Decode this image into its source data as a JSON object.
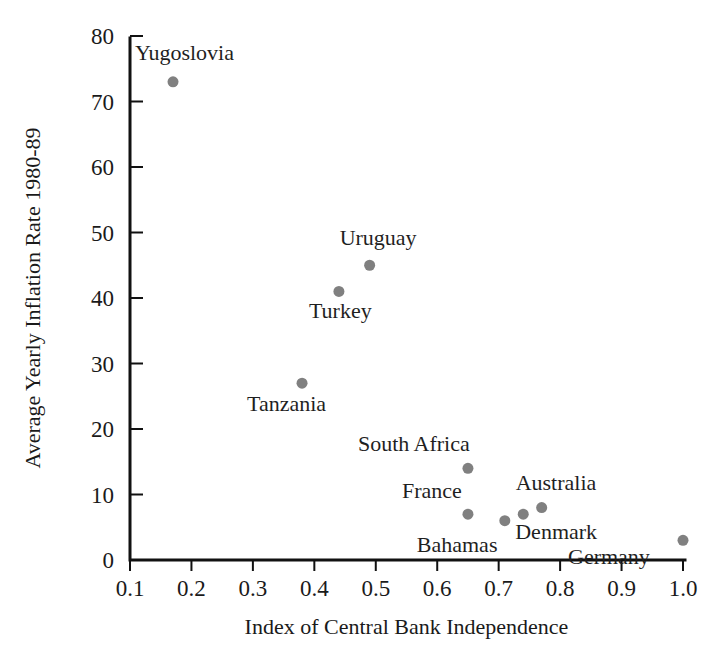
{
  "chart_data": {
    "type": "scatter",
    "title": "",
    "xlabel": "Index of Central Bank Independence",
    "ylabel": "Average Yearly Inflation Rate 1980-89",
    "xlim": [
      0.1,
      1.0
    ],
    "ylim": [
      0,
      80
    ],
    "grid": false,
    "legend": "none",
    "marker_color": "#808080",
    "axis_color": "#111111",
    "xticks": [
      "0.1",
      "0.2",
      "0.3",
      "0.4",
      "0.5",
      "0.6",
      "0.7",
      "0.8",
      "0.9",
      "1.0"
    ],
    "xtick_values": [
      0.1,
      0.2,
      0.3,
      0.4,
      0.5,
      0.6,
      0.7,
      0.8,
      0.9,
      1.0
    ],
    "yticks": [
      "0",
      "10",
      "20",
      "30",
      "40",
      "50",
      "60",
      "70",
      "80"
    ],
    "ytick_values": [
      0,
      10,
      20,
      30,
      40,
      50,
      60,
      70,
      80
    ],
    "points": [
      {
        "label": "Yugoslovia",
        "x": 0.17,
        "y": 73,
        "label_dx": -38,
        "label_dy": -22,
        "label_anchor": "start"
      },
      {
        "label": "Uruguay",
        "x": 0.49,
        "y": 45,
        "label_dx": -30,
        "label_dy": -20,
        "label_anchor": "start"
      },
      {
        "label": "Turkey",
        "x": 0.44,
        "y": 41,
        "label_dx": -30,
        "label_dy": 27,
        "label_anchor": "start"
      },
      {
        "label": "Tanzania",
        "x": 0.38,
        "y": 27,
        "label_dx": -55,
        "label_dy": 28,
        "label_anchor": "start"
      },
      {
        "label": "South Africa",
        "x": 0.65,
        "y": 14,
        "label_dx": -110,
        "label_dy": -17,
        "label_anchor": "start"
      },
      {
        "label": "France",
        "x": 0.65,
        "y": 7,
        "label_dx": -66,
        "label_dy": -16,
        "label_anchor": "start"
      },
      {
        "label": "Bahamas",
        "x": 0.71,
        "y": 6,
        "label_dx": -88,
        "label_dy": 31,
        "label_anchor": "start"
      },
      {
        "label": "Denmark",
        "x": 0.74,
        "y": 7,
        "label_dx": -8,
        "label_dy": 25,
        "label_anchor": "start"
      },
      {
        "label": "Australia",
        "x": 0.77,
        "y": 8,
        "label_dx": -26,
        "label_dy": -18,
        "label_anchor": "start"
      },
      {
        "label": "Germany",
        "x": 1.0,
        "y": 3,
        "label_dx": -115,
        "label_dy": 24,
        "label_anchor": "start"
      }
    ]
  },
  "figure": {
    "background": "#ffffff"
  }
}
